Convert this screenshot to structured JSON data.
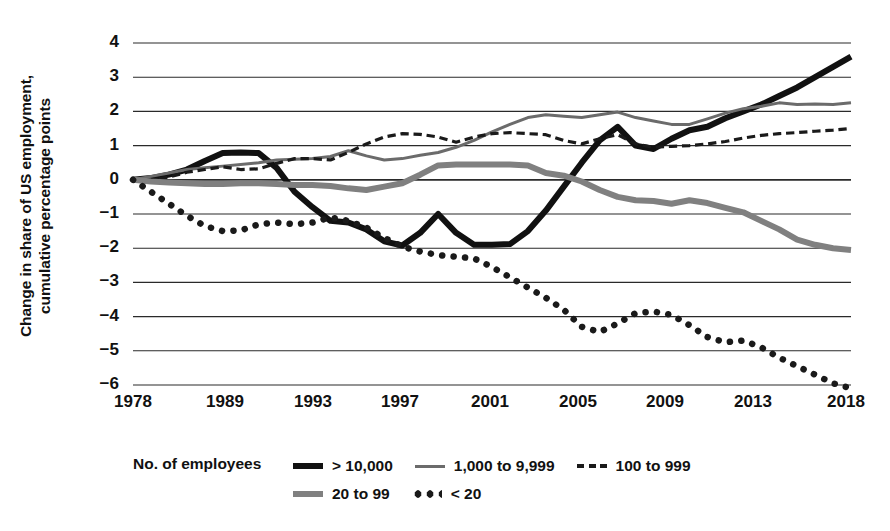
{
  "chart_data": {
    "type": "line",
    "title": "",
    "xlabel": "",
    "ylabel": "Change in share of US employment,\ncumulative percentage points",
    "xlim": [
      1978,
      2018
    ],
    "ylim": [
      -6,
      4
    ],
    "grid": true,
    "legend_position": "bottom",
    "legend_title": "No. of employees",
    "y_ticks": [
      "4",
      "3",
      "2",
      "1",
      "0",
      "-1",
      "-2",
      "-3",
      "-4",
      "-5",
      "-6"
    ],
    "x_ticks": [
      "1978",
      "1989",
      "1993",
      "1997",
      "2001",
      "2005",
      "2009",
      "2013",
      "2018"
    ],
    "x": [
      1978,
      1979,
      1980,
      1981,
      1982,
      1983,
      1984,
      1985,
      1986,
      1987,
      1988,
      1989,
      1990,
      1991,
      1992,
      1993,
      1994,
      1995,
      1996,
      1997,
      1998,
      1999,
      2000,
      2001,
      2002,
      2003,
      2004,
      2005,
      2006,
      2007,
      2008,
      2009,
      2010,
      2011,
      2012,
      2013,
      2014,
      2015,
      2016,
      2017,
      2018
    ],
    "series": [
      {
        "name": "> 10,000",
        "style": "solid-thick",
        "color": "#111111",
        "width": 6,
        "values": [
          0,
          0.05,
          0.15,
          0.3,
          0.55,
          0.78,
          0.8,
          0.78,
          0.35,
          -0.35,
          -0.8,
          -1.2,
          -1.25,
          -1.45,
          -1.8,
          -1.92,
          -1.55,
          -1.0,
          -1.55,
          -1.9,
          -1.9,
          -1.88,
          -1.5,
          -0.9,
          -0.2,
          0.5,
          1.15,
          1.55,
          1.0,
          0.9,
          1.2,
          1.45,
          1.55,
          1.8,
          2.0,
          2.2,
          2.45,
          2.7,
          3.0,
          3.3,
          3.6
        ]
      },
      {
        "name": "1,000 to 9,999",
        "style": "solid-thin",
        "color": "#6b6b6b",
        "width": 3,
        "values": [
          0,
          0.1,
          0.2,
          0.3,
          0.35,
          0.4,
          0.45,
          0.5,
          0.58,
          0.6,
          0.62,
          0.68,
          0.85,
          0.7,
          0.58,
          0.62,
          0.72,
          0.8,
          0.95,
          1.15,
          1.4,
          1.62,
          1.82,
          1.9,
          1.86,
          1.82,
          1.9,
          1.98,
          1.82,
          1.72,
          1.62,
          1.62,
          1.78,
          1.95,
          2.08,
          2.15,
          2.25,
          2.2,
          2.22,
          2.2,
          2.25
        ]
      },
      {
        "name": "100 to 999",
        "style": "dashed",
        "color": "#1a1a1a",
        "width": 3.2,
        "values": [
          0,
          -0.02,
          0.08,
          0.22,
          0.3,
          0.38,
          0.3,
          0.32,
          0.48,
          0.62,
          0.62,
          0.58,
          0.8,
          1.05,
          1.25,
          1.35,
          1.33,
          1.25,
          1.1,
          1.25,
          1.35,
          1.38,
          1.35,
          1.32,
          1.15,
          1.05,
          1.2,
          1.32,
          1.05,
          0.95,
          0.98,
          1.0,
          1.05,
          1.12,
          1.22,
          1.3,
          1.35,
          1.38,
          1.42,
          1.45,
          1.5
        ]
      },
      {
        "name": "20 to 99",
        "style": "solid-med",
        "color": "#808080",
        "width": 6,
        "values": [
          0,
          -0.05,
          -0.08,
          -0.1,
          -0.12,
          -0.12,
          -0.1,
          -0.1,
          -0.12,
          -0.15,
          -0.15,
          -0.18,
          -0.25,
          -0.3,
          -0.2,
          -0.1,
          0.15,
          0.42,
          0.45,
          0.45,
          0.45,
          0.45,
          0.42,
          0.2,
          0.12,
          -0.05,
          -0.3,
          -0.5,
          -0.6,
          -0.62,
          -0.7,
          -0.6,
          -0.68,
          -0.82,
          -0.95,
          -1.2,
          -1.45,
          -1.75,
          -1.9,
          -2.0,
          -2.05
        ]
      },
      {
        "name": "< 20",
        "style": "dotted",
        "color": "#1a1a1a",
        "width": 6.5,
        "values": [
          0,
          -0.35,
          -0.7,
          -1.05,
          -1.35,
          -1.5,
          -1.48,
          -1.3,
          -1.25,
          -1.3,
          -1.25,
          -1.1,
          -1.2,
          -1.4,
          -1.7,
          -1.95,
          -2.1,
          -2.2,
          -2.25,
          -2.3,
          -2.55,
          -2.85,
          -3.15,
          -3.45,
          -3.8,
          -4.3,
          -4.45,
          -4.2,
          -3.9,
          -3.85,
          -3.95,
          -4.25,
          -4.6,
          -4.75,
          -4.7,
          -4.9,
          -5.2,
          -5.45,
          -5.7,
          -5.95,
          -6.1
        ]
      }
    ]
  }
}
